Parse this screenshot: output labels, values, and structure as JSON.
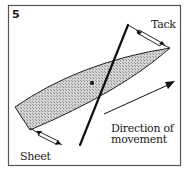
{
  "figure": {
    "number": "5",
    "labels": {
      "tack": "Tack",
      "sheet": "Sheet",
      "direction_line1": "Direction of",
      "direction_line2": "movement"
    },
    "colors": {
      "frame": "#555555",
      "ink": "#1a1a1a",
      "sail_fill": "#c8c8c8",
      "background": "#ffffff"
    }
  }
}
